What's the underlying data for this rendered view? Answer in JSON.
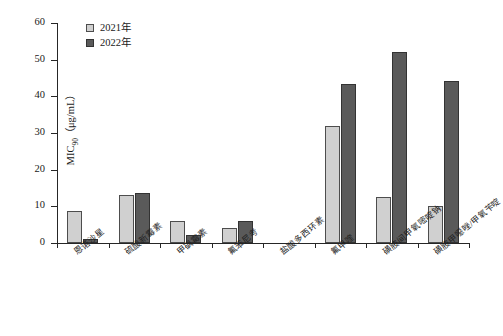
{
  "chart_data": {
    "type": "bar",
    "title": "",
    "xlabel": "",
    "ylabel": "MIC90 (μg/mL)",
    "ylabel_main": "MIC",
    "ylabel_sub": "90",
    "ylabel_unit": "（μg/mL）",
    "ylim": [
      0,
      60
    ],
    "yticks": [
      0,
      10,
      20,
      30,
      40,
      50,
      60
    ],
    "grid": false,
    "legend_position": "top-left",
    "categories": [
      "恩诺沙星",
      "硫酸新霉素",
      "甲砜霉素",
      "氟苯尼考",
      "盐酸多西环素",
      "氟甲喹",
      "磺胺间甲氧嘧啶钠",
      "磺胺甲噁唑/甲氧苄啶"
    ],
    "series": [
      {
        "name": "2021年",
        "color": "#d0d0d0",
        "values": [
          8.6,
          13.2,
          6.0,
          4.0,
          0,
          32.0,
          12.6,
          10.0
        ]
      },
      {
        "name": "2022年",
        "color": "#5a5a5a",
        "values": [
          1.0,
          13.6,
          2.1,
          6.0,
          0,
          43.3,
          52.0,
          44.2
        ]
      }
    ]
  },
  "legend": {
    "items": [
      {
        "label": "2021年",
        "swatch": "light-gray-square"
      },
      {
        "label": "2022年",
        "swatch": "dark-gray-square"
      }
    ]
  },
  "axes": {
    "y_tick_labels": [
      "0",
      "10",
      "20",
      "30",
      "40",
      "50",
      "60"
    ]
  }
}
